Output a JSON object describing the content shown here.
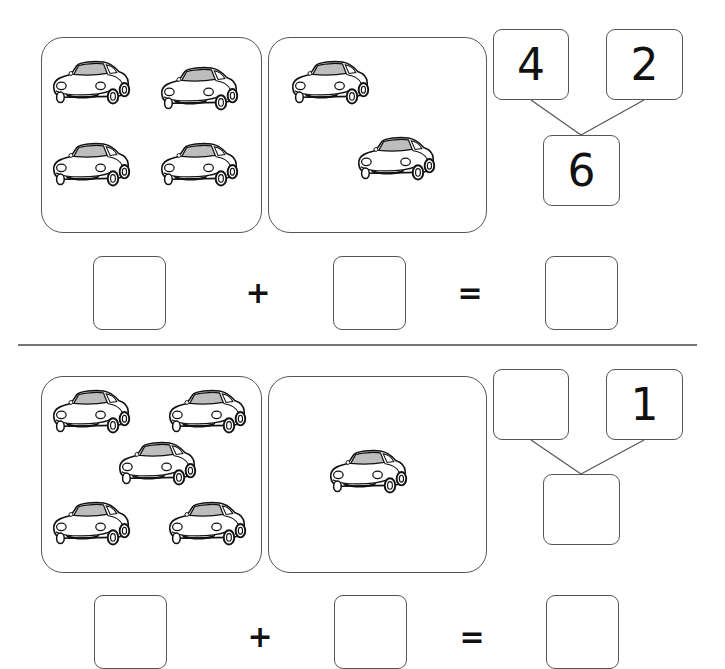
{
  "worksheet": {
    "problems": [
      {
        "left_panel": {
          "car_count": 4,
          "icon": "car-icon"
        },
        "right_panel": {
          "car_count": 2,
          "icon": "car-icon"
        },
        "number_bond": {
          "part_a": "4",
          "part_b": "2",
          "whole": "6"
        },
        "equation": {
          "addend_1": "",
          "plus": "+",
          "addend_2": "",
          "equals": "=",
          "sum": ""
        }
      },
      {
        "left_panel": {
          "car_count": 5,
          "icon": "car-icon"
        },
        "right_panel": {
          "car_count": 1,
          "icon": "car-icon"
        },
        "number_bond": {
          "part_a": "",
          "part_b": "1",
          "whole": ""
        },
        "equation": {
          "addend_1": "",
          "plus": "+",
          "addend_2": "",
          "equals": "=",
          "sum": ""
        }
      }
    ]
  }
}
